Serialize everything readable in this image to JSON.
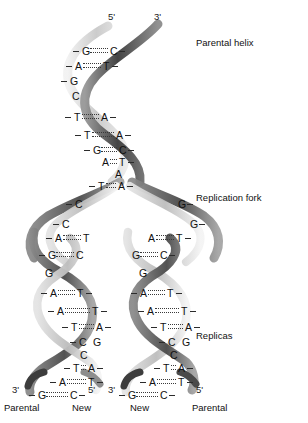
{
  "figure": {
    "background": "#ffffff",
    "ink": "#111111"
  },
  "colors": {
    "parental_strand_dark": "#4a4a4a",
    "parental_strand_mid": "#8a8a8a",
    "new_strand_light": "#d2d2d2",
    "new_strand_pale": "#ededed",
    "bond": "#3a3a3a",
    "tick": "#2b2b2b"
  },
  "end_labels": {
    "top_left": "5'",
    "top_right": "3'",
    "replica_left_3": "3'",
    "replica_left_5": "5'",
    "replica_right_3": "3'",
    "replica_right_5": "5'"
  },
  "annotations": [
    {
      "id": "parental-helix",
      "label": "Parental helix",
      "x": 196,
      "y": 38
    },
    {
      "id": "replication-fork",
      "label": "Replication fork",
      "x": 196,
      "y": 193
    },
    {
      "id": "replicas",
      "label": "Replicas",
      "x": 196,
      "y": 331
    }
  ],
  "foot_labels": [
    {
      "id": "foot-parental-left",
      "label": "Parental",
      "x": 4,
      "y": 403
    },
    {
      "id": "foot-new-left",
      "label": "New",
      "x": 72,
      "y": 403
    },
    {
      "id": "foot-new-right",
      "label": "New",
      "x": 130,
      "y": 403
    },
    {
      "id": "foot-parental-right",
      "label": "Parental",
      "x": 192,
      "y": 403
    }
  ],
  "parental_helix": {
    "name": "Parental helix base pairs",
    "pairs": [
      {
        "left": "G",
        "right": "C",
        "lx": 82,
        "rx": 110,
        "y": 46,
        "bond": true,
        "lead": true,
        "trail": true
      },
      {
        "left": "A",
        "right": "T",
        "lx": 75,
        "rx": 103,
        "y": 61,
        "bond": true,
        "lead": true,
        "trail": true
      },
      {
        "left": "G",
        "right": "",
        "lx": 70,
        "rx": 0,
        "y": 76,
        "bond": false,
        "lead": true,
        "trail": false
      },
      {
        "left": "C",
        "right": "",
        "lx": 72,
        "rx": 0,
        "y": 91,
        "bond": false,
        "lead": false,
        "trail": false
      },
      {
        "left": "T",
        "right": "A",
        "lx": 74,
        "rx": 101,
        "y": 112,
        "bond": true,
        "lead": true,
        "trail": true
      },
      {
        "left": "T",
        "right": "A",
        "lx": 84,
        "rx": 116,
        "y": 130,
        "bond": true,
        "lead": true,
        "trail": true
      },
      {
        "left": "G",
        "right": "C",
        "lx": 93,
        "rx": 119,
        "y": 145,
        "bond": true,
        "lead": true,
        "trail": true
      },
      {
        "left": "A",
        "right": "T",
        "lx": 102,
        "rx": 119,
        "y": 157,
        "bond": true,
        "lead": false,
        "trail": true
      },
      {
        "left": "",
        "right": "A",
        "lx": 0,
        "rx": 115,
        "y": 169,
        "bond": false,
        "lead": false,
        "trail": false
      },
      {
        "left": "T",
        "right": "A",
        "lx": 98,
        "rx": 118,
        "y": 181,
        "bond": true,
        "lead": true,
        "trail": true
      }
    ]
  },
  "fork_single_bases": {
    "name": "Unpaired bases at replication fork",
    "left_branch": [
      {
        "base": "C",
        "x": 75,
        "y": 199,
        "tick_side": "left"
      },
      {
        "base": "C",
        "x": 62,
        "y": 219,
        "tick_side": "left"
      }
    ],
    "right_branch": [
      {
        "base": "G",
        "x": 178,
        "y": 199,
        "tick_side": "right"
      },
      {
        "base": "G",
        "x": 190,
        "y": 219,
        "tick_side": "right"
      }
    ]
  },
  "replica_left": {
    "name": "Left replica duplex (Parental + New)",
    "strand_left_origin": "Parental",
    "strand_right_origin": "New",
    "pairs": [
      {
        "left": "A",
        "right": "T",
        "lx": 55,
        "rx": 83,
        "y": 233,
        "bond": true,
        "lead": true,
        "trail": false
      },
      {
        "left": "G",
        "right": "C",
        "lx": 48,
        "rx": 76,
        "y": 250,
        "bond": true,
        "lead": true,
        "trail": false
      },
      {
        "left": "G",
        "right": "",
        "lx": 45,
        "rx": 0,
        "y": 268,
        "bond": false,
        "lead": false,
        "trail": false
      },
      {
        "left": "A",
        "right": "T",
        "lx": 50,
        "rx": 77,
        "y": 288,
        "bond": true,
        "lead": true,
        "trail": true
      },
      {
        "left": "A",
        "right": "T",
        "lx": 57,
        "rx": 92,
        "y": 306,
        "bond": true,
        "lead": true,
        "trail": true
      },
      {
        "left": "T",
        "right": "A",
        "lx": 71,
        "rx": 96,
        "y": 322,
        "bond": true,
        "lead": true,
        "trail": true
      },
      {
        "left": "C",
        "right": "G",
        "lx": 79,
        "rx": 93,
        "y": 337,
        "bond": false,
        "lead": true,
        "trail": false
      },
      {
        "left": "C",
        "right": "",
        "lx": 80,
        "rx": 0,
        "y": 350,
        "bond": false,
        "lead": false,
        "trail": false
      },
      {
        "left": "T",
        "right": "A",
        "lx": 73,
        "rx": 88,
        "y": 363,
        "bond": true,
        "lead": true,
        "trail": true
      },
      {
        "left": "A",
        "right": "T",
        "lx": 59,
        "rx": 88,
        "y": 377,
        "bond": true,
        "lead": true,
        "trail": true
      },
      {
        "left": "G",
        "right": "C",
        "lx": 38,
        "rx": 70,
        "y": 390,
        "bond": true,
        "lead": true,
        "trail": true
      }
    ]
  },
  "replica_right": {
    "name": "Right replica duplex (New + Parental)",
    "strand_left_origin": "New",
    "strand_right_origin": "Parental",
    "pairs": [
      {
        "left": "A",
        "right": "T",
        "lx": 148,
        "rx": 176,
        "y": 233,
        "bond": true,
        "lead": false,
        "trail": true
      },
      {
        "left": "G",
        "right": "C",
        "lx": 132,
        "rx": 160,
        "y": 250,
        "bond": true,
        "lead": false,
        "trail": true
      },
      {
        "left": "G",
        "right": "",
        "lx": 139,
        "rx": 0,
        "y": 268,
        "bond": false,
        "lead": false,
        "trail": false
      },
      {
        "left": "A",
        "right": "T",
        "lx": 140,
        "rx": 167,
        "y": 288,
        "bond": true,
        "lead": true,
        "trail": true
      },
      {
        "left": "A",
        "right": "T",
        "lx": 147,
        "rx": 181,
        "y": 306,
        "bond": true,
        "lead": true,
        "trail": true
      },
      {
        "left": "T",
        "right": "A",
        "lx": 160,
        "rx": 185,
        "y": 322,
        "bond": true,
        "lead": true,
        "trail": true
      },
      {
        "left": "C",
        "right": "G",
        "lx": 168,
        "rx": 182,
        "y": 337,
        "bond": false,
        "lead": true,
        "trail": false
      },
      {
        "left": "C",
        "right": "",
        "lx": 170,
        "rx": 0,
        "y": 350,
        "bond": false,
        "lead": false,
        "trail": false
      },
      {
        "left": "T",
        "right": "A",
        "lx": 163,
        "rx": 178,
        "y": 363,
        "bond": true,
        "lead": true,
        "trail": true
      },
      {
        "left": "A",
        "right": "T",
        "lx": 149,
        "rx": 178,
        "y": 377,
        "bond": true,
        "lead": true,
        "trail": true
      },
      {
        "left": "G",
        "right": "C",
        "lx": 128,
        "rx": 160,
        "y": 390,
        "bond": true,
        "lead": true,
        "trail": true
      }
    ]
  }
}
